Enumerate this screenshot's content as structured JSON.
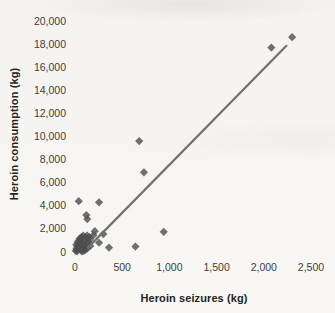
{
  "chart_data": {
    "type": "scatter",
    "title": "",
    "xlabel": "Heroin seizures (kg)",
    "ylabel": "Heroin consumption (kg)",
    "xlim": [
      0,
      2500
    ],
    "ylim": [
      0,
      20000
    ],
    "grid": false,
    "legend": "none",
    "marker": "diamond",
    "marker_color": "#4e4e4e",
    "x_ticks": [
      {
        "value": 0,
        "label": "0"
      },
      {
        "value": 500,
        "label": "500"
      },
      {
        "value": 1000,
        "label": "1,000"
      },
      {
        "value": 1500,
        "label": "1,500"
      },
      {
        "value": 2000,
        "label": "2,000"
      },
      {
        "value": 2500,
        "label": "2,500"
      }
    ],
    "y_ticks": [
      {
        "value": 0,
        "label": "0"
      },
      {
        "value": 2000,
        "label": "2,000"
      },
      {
        "value": 4000,
        "label": "4,000"
      },
      {
        "value": 6000,
        "label": "6,000"
      },
      {
        "value": 8000,
        "label": "8,000"
      },
      {
        "value": 10000,
        "label": "10,000"
      },
      {
        "value": 12000,
        "label": "12,000"
      },
      {
        "value": 14000,
        "label": "14,000"
      },
      {
        "value": 16000,
        "label": "16,000"
      },
      {
        "value": 18000,
        "label": "18,000"
      },
      {
        "value": 20000,
        "label": "20,000"
      }
    ],
    "trendline": {
      "x1": 140,
      "y1": 400,
      "x2": 2240,
      "y2": 17850,
      "color": "#717171"
    },
    "points": [
      [
        2300,
        18600
      ],
      [
        2080,
        17700
      ],
      [
        680,
        9600
      ],
      [
        730,
        6900
      ],
      [
        40,
        4400
      ],
      [
        255,
        4300
      ],
      [
        120,
        3200
      ],
      [
        130,
        2850
      ],
      [
        940,
        1750
      ],
      [
        640,
        470
      ],
      [
        360,
        380
      ],
      [
        255,
        800
      ],
      [
        210,
        1800
      ],
      [
        300,
        1550
      ],
      [
        150,
        1300
      ],
      [
        195,
        1460
      ],
      [
        8,
        100
      ],
      [
        15,
        300
      ],
      [
        25,
        520
      ],
      [
        38,
        740
      ],
      [
        52,
        950
      ],
      [
        14,
        620
      ],
      [
        28,
        880
      ],
      [
        48,
        1150
      ],
      [
        68,
        1280
      ],
      [
        88,
        1430
      ],
      [
        62,
        180
      ],
      [
        82,
        350
      ],
      [
        102,
        560
      ],
      [
        122,
        700
      ],
      [
        142,
        880
      ],
      [
        158,
        1080
      ],
      [
        98,
        1000
      ],
      [
        112,
        1250
      ],
      [
        22,
        60
      ],
      [
        58,
        640
      ],
      [
        78,
        800
      ],
      [
        108,
        180
      ],
      [
        132,
        320
      ],
      [
        162,
        520
      ],
      [
        92,
        90
      ],
      [
        45,
        420
      ],
      [
        72,
        50
      ],
      [
        128,
        1420
      ]
    ]
  }
}
